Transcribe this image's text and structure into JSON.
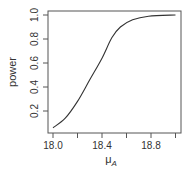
{
  "chart_data": {
    "type": "line",
    "title": "",
    "xlabel": "μ_A",
    "ylabel": "power",
    "x_ticks": [
      18.0,
      18.2,
      18.4,
      18.6,
      18.8,
      19.0
    ],
    "x_tick_labels": [
      "18.0",
      "18.4",
      "18.8"
    ],
    "y_ticks": [
      0.2,
      0.4,
      0.6,
      0.8,
      1.0
    ],
    "y_tick_labels": [
      "0.2",
      "0.4",
      "0.6",
      "0.8",
      "1.0"
    ],
    "xlim": [
      17.97,
      19.05
    ],
    "ylim": [
      0.0,
      1.03
    ],
    "grid": false,
    "legend": null,
    "series": [
      {
        "name": "power",
        "x": [
          18.0,
          18.1,
          18.2,
          18.3,
          18.4,
          18.48,
          18.55,
          18.65,
          18.78,
          19.0
        ],
        "y": [
          0.06,
          0.14,
          0.28,
          0.46,
          0.64,
          0.81,
          0.9,
          0.96,
          0.99,
          1.0
        ]
      }
    ],
    "color": "#333333"
  },
  "labels": {
    "ylabel": "power",
    "xlabel_main": "μ",
    "xlabel_sub": "A"
  }
}
